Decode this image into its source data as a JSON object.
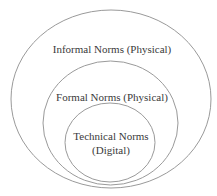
{
  "diagram": {
    "type": "nested-ellipses",
    "layers": [
      {
        "label": "Informal Norms (Physical)",
        "lines": [
          "Informal Norms (Physical)"
        ]
      },
      {
        "label": "Formal Norms (Physical)",
        "lines": [
          "Formal Norms (Physical)"
        ]
      },
      {
        "label": "Technical Norms (Digital)",
        "lines": [
          "Technical Norms",
          "(Digital)"
        ]
      }
    ],
    "colors": {
      "stroke": "#9a9a9a",
      "text": "#3a3a3a",
      "background": "#ffffff"
    }
  }
}
